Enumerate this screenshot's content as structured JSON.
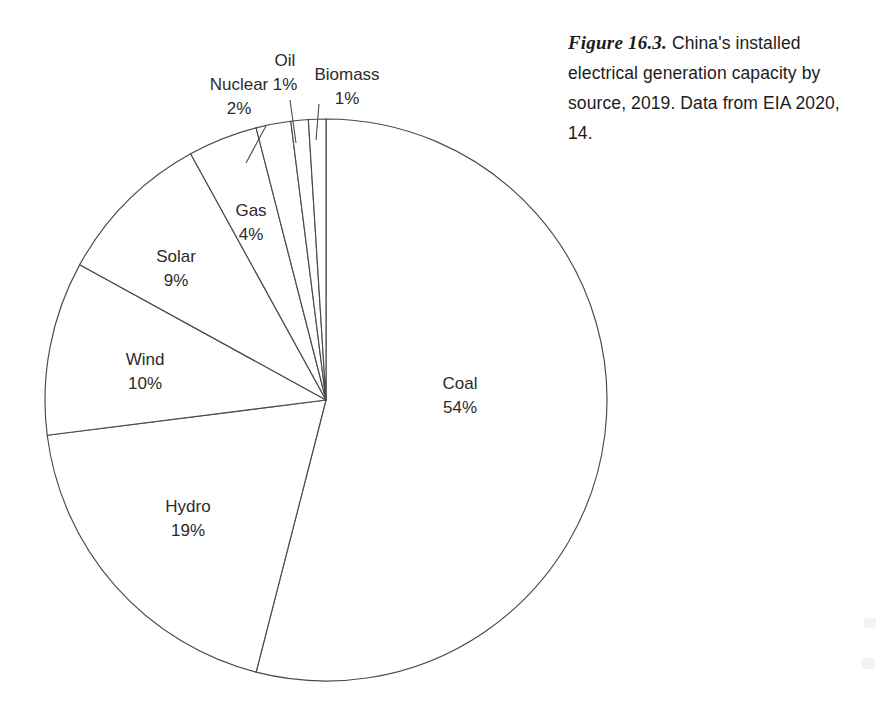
{
  "figure": {
    "number_label": "Figure 16.3.",
    "caption_text": " China's installed electrical generation capacity by source, 2019. Data from EIA 2020, 14.",
    "caption_full": "Figure 16.3. China's installed electrical generation capacity by source, 2019. Data from EIA 2020, 14."
  },
  "chart_data": {
    "type": "pie",
    "title": "China's installed electrical generation capacity by source, 2019",
    "source_note": "Data from EIA 2020, 14.",
    "unit": "percent",
    "legend": "none",
    "labels_inline": true,
    "start_angle_deg": -90,
    "direction": "clockwise",
    "categories": [
      "Coal",
      "Hydro",
      "Wind",
      "Solar",
      "Gas",
      "Nuclear",
      "Oil",
      "Biomass"
    ],
    "values": [
      54,
      19,
      10,
      9,
      4,
      2,
      1,
      1
    ],
    "slices": [
      {
        "name": "Coal",
        "value": 54,
        "label": "Coal",
        "value_label": "54%",
        "label_x": 460,
        "label_y": 385,
        "value_y": 409,
        "callout": false
      },
      {
        "name": "Hydro",
        "value": 19,
        "label": "Hydro",
        "value_label": "19%",
        "label_x": 188,
        "label_y": 508,
        "value_y": 532,
        "callout": false
      },
      {
        "name": "Wind",
        "value": 10,
        "label": "Wind",
        "value_label": "10%",
        "label_x": 145,
        "label_y": 361,
        "value_y": 385,
        "callout": false
      },
      {
        "name": "Solar",
        "value": 9,
        "label": "Solar",
        "value_label": "9%",
        "label_x": 176,
        "label_y": 258,
        "value_y": 282,
        "callout": false
      },
      {
        "name": "Gas",
        "value": 4,
        "label": "Gas",
        "value_label": "4%",
        "label_x": 251,
        "label_y": 212,
        "value_y": 236,
        "callout": false
      },
      {
        "name": "Nuclear",
        "value": 2,
        "label": "Nuclear",
        "value_label": "2%",
        "label_x": 239,
        "label_y": 86,
        "value_y": 110,
        "callout": true,
        "leader_x1": 266,
        "leader_y1": 126,
        "leader_x2": 246,
        "leader_y2": 163
      },
      {
        "name": "Oil",
        "value": 1,
        "label": "Oil",
        "value_label": "1%",
        "label_x": 285,
        "label_y": 62,
        "value_y": 86,
        "callout": true,
        "leader_x1": 290,
        "leader_y1": 100,
        "leader_x2": 296,
        "leader_y2": 143
      },
      {
        "name": "Biomass",
        "value": 1,
        "label": "Biomass",
        "value_label": "1%",
        "label_x": 347,
        "label_y": 76,
        "value_y": 100,
        "callout": true,
        "leader_x1": 319,
        "leader_y1": 104,
        "leader_x2": 316,
        "leader_y2": 140
      }
    ],
    "geometry": {
      "center_x": 326,
      "center_y": 400,
      "radius": 281
    }
  },
  "colors": {
    "background": "#ffffff",
    "stroke": "#4a4a4a",
    "slice_fill": "#ffffff",
    "text": "#2b2b2b",
    "caption_text": "#1c1c1c"
  }
}
